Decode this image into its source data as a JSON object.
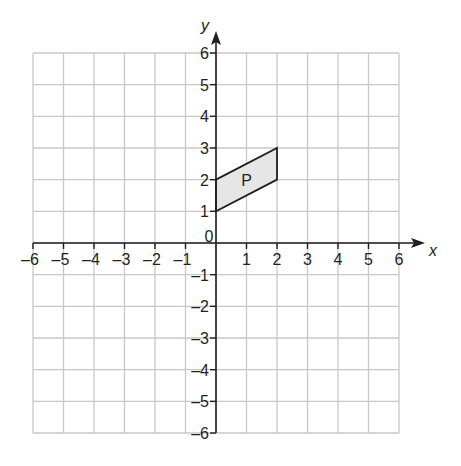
{
  "diagram": {
    "type": "coordinate-grid",
    "x_axis": {
      "label": "x",
      "min": -6,
      "max": 6,
      "ticks": [
        "-6",
        "-5",
        "-4",
        "-3",
        "-2",
        "-1",
        "0",
        "1",
        "2",
        "3",
        "4",
        "5",
        "6"
      ]
    },
    "y_axis": {
      "label": "y",
      "min": -6,
      "max": 6,
      "ticks": [
        "-6",
        "-5",
        "-4",
        "-3",
        "-2",
        "-1",
        "1",
        "2",
        "3",
        "4",
        "5",
        "6"
      ]
    },
    "origin_label": "0",
    "shapes": [
      {
        "name": "P",
        "type": "parallelogram",
        "vertices": [
          [
            0,
            1
          ],
          [
            0,
            2
          ],
          [
            2,
            3
          ],
          [
            2,
            2
          ]
        ],
        "label_position": [
          1,
          2
        ],
        "fill": "#e6e6e6",
        "stroke": "#231f20"
      }
    ],
    "colors": {
      "grid": "#c8c8c8",
      "axis": "#231f20",
      "background": "#ffffff"
    }
  }
}
